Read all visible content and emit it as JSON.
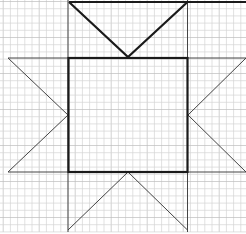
{
  "diagram": {
    "title": "",
    "colors": {
      "background": "#ffffff",
      "grid_minor": "#d4d4d4",
      "grid_major": "#bdbdbd",
      "thick_line": "#1a1a1a",
      "thin_line": "#444444"
    },
    "shapes": [
      {
        "name": "center-square",
        "kind": "square",
        "weight": "thick"
      },
      {
        "name": "top-star-point",
        "kind": "v-shape",
        "direction": "down",
        "weight": "thick"
      },
      {
        "name": "left-star-point",
        "kind": "triangle",
        "direction": "right",
        "weight": "thin"
      },
      {
        "name": "right-star-point",
        "kind": "triangle",
        "direction": "left",
        "weight": "thin"
      },
      {
        "name": "bottom-star-point",
        "kind": "v-shape",
        "direction": "up",
        "weight": "thin"
      }
    ]
  }
}
